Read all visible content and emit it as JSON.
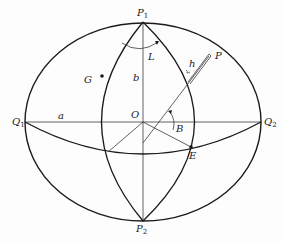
{
  "diagram": {
    "points": {
      "P1": {
        "label": "P",
        "sub": "1"
      },
      "P2": {
        "label": "P",
        "sub": "2"
      },
      "Q1": {
        "label": "Q",
        "sub": "1"
      },
      "Q2": {
        "label": "Q",
        "sub": "2"
      },
      "O": {
        "label": "O",
        "sub": ""
      },
      "G": {
        "label": "G",
        "sub": ""
      },
      "E": {
        "label": "E",
        "sub": ""
      },
      "P": {
        "label": "P",
        "sub": ""
      }
    },
    "quantities": {
      "a": "a",
      "b": "b",
      "L": "L",
      "B": "B",
      "h": "h"
    },
    "colors": {
      "stroke": "#1a1a1a",
      "thin_stroke": "#3a3a3a",
      "background": "#fdfdfd"
    }
  }
}
